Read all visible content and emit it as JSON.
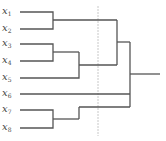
{
  "diagram": {
    "type": "dendrogram",
    "leaves": [
      {
        "name": "x",
        "sub": "1",
        "y": 12
      },
      {
        "name": "x",
        "sub": "2",
        "y": 29
      },
      {
        "name": "x",
        "sub": "3",
        "y": 44
      },
      {
        "name": "x",
        "sub": "4",
        "y": 61
      },
      {
        "name": "x",
        "sub": "5",
        "y": 78
      },
      {
        "name": "x",
        "sub": "6",
        "y": 94
      },
      {
        "name": "x",
        "sub": "7",
        "y": 110
      },
      {
        "name": "x",
        "sub": "8",
        "y": 128
      }
    ],
    "line_color": "#555555",
    "cut_line_color": "#bbbbbb",
    "cut_line_x": 98
  }
}
